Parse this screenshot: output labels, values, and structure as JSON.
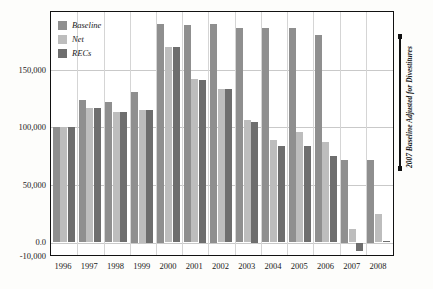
{
  "chart_data": {
    "type": "bar",
    "title": "",
    "xlabel": "",
    "ylabel": "",
    "ylim": [
      -10000,
      200000
    ],
    "grid": true,
    "legend_position": "top-left",
    "categories": [
      "1996",
      "1997",
      "1998",
      "1999",
      "2000",
      "2001",
      "2002",
      "2003",
      "2004",
      "2005",
      "2006",
      "2007",
      "2008"
    ],
    "ytick_labels": [
      "150,000",
      "100,000",
      "50,000",
      "0.0",
      "-10,000"
    ],
    "ytick_values": [
      150000,
      100000,
      50000,
      0,
      -10000
    ],
    "series": [
      {
        "name": "Baseline",
        "color": "#8f8f8f",
        "values": [
          100000,
          124000,
          122000,
          131000,
          190000,
          189000,
          190000,
          186000,
          186000,
          186000,
          180000,
          72000,
          72000
        ]
      },
      {
        "name": "Net",
        "color": "#bdbdbd",
        "values": [
          100000,
          117000,
          113000,
          115000,
          170000,
          142000,
          133000,
          106000,
          89000,
          96000,
          87000,
          12000,
          25000
        ]
      },
      {
        "name": "RECs",
        "color": "#6e6e6e",
        "values": [
          100000,
          117000,
          113000,
          115000,
          170000,
          141000,
          133000,
          105000,
          84000,
          84000,
          75000,
          -7000,
          1500
        ]
      }
    ],
    "annotation": {
      "text": "2007 Baseline Adjusted for Divestitures"
    }
  }
}
